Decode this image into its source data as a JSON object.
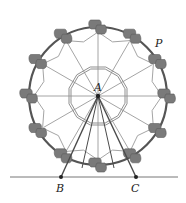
{
  "diagram": {
    "labels": {
      "center": "A",
      "rim_point": "P",
      "left_base": "B",
      "right_base": "C"
    },
    "wheel": {
      "center": [
        98,
        96
      ],
      "outer_radius": 69,
      "inner_radius": 30,
      "spokes": 12,
      "cars": 12
    },
    "ground_y": 177,
    "base_points": {
      "B": [
        61,
        177
      ],
      "C": [
        136,
        177
      ]
    },
    "colors": {
      "rim": "#555555",
      "spoke": "#9a9a9a",
      "inner_polygon": "#8f8f8f",
      "car": "#7a7a7a",
      "support": "#4a4a4a",
      "ground": "#777777",
      "point": "#222222"
    }
  }
}
